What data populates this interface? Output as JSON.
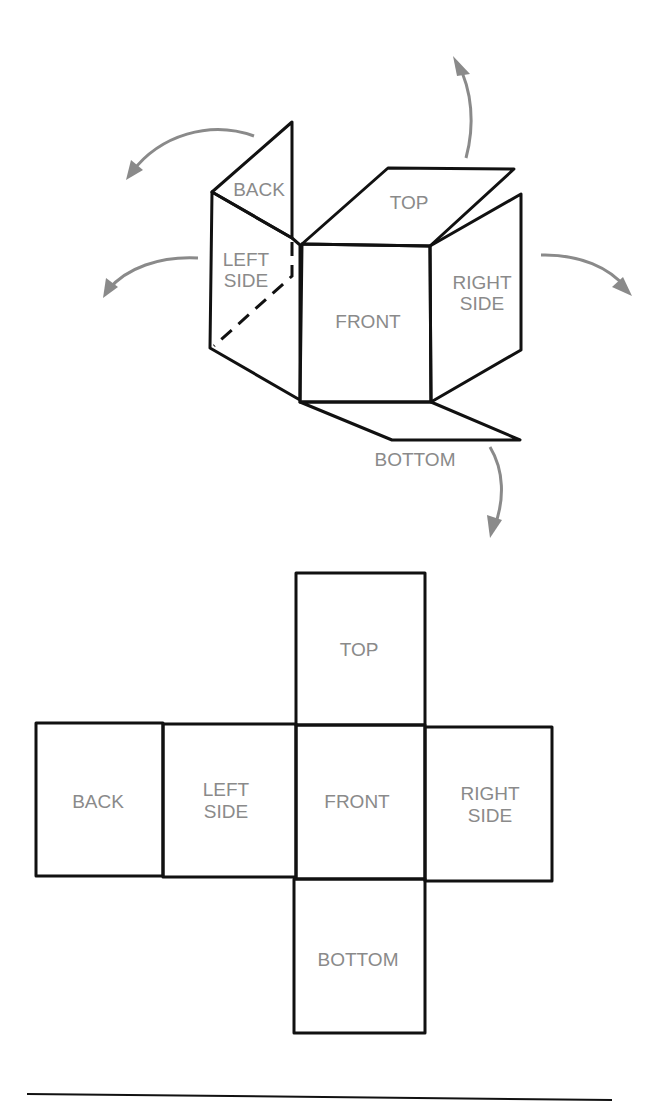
{
  "folded_box": {
    "labels": {
      "back": "BACK",
      "left_side": [
        "LEFT",
        "SIDE"
      ],
      "top": "TOP",
      "front": "FRONT",
      "right_side": [
        "RIGHT",
        "SIDE"
      ],
      "bottom": "BOTTOM"
    },
    "arrow_color": "#8a8a8a"
  },
  "net": {
    "labels": {
      "top": "TOP",
      "back": "BACK",
      "left_side": [
        "LEFT",
        "SIDE"
      ],
      "front": "FRONT",
      "right_side": [
        "RIGHT",
        "SIDE"
      ],
      "bottom": "BOTTOM"
    }
  },
  "colors": {
    "line": "#111111",
    "label": "#8a8a8a",
    "background": "#ffffff"
  }
}
